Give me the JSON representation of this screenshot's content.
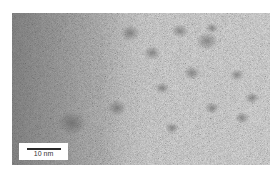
{
  "figure": {
    "type": "TEM micrograph",
    "colors": {
      "background": "#ffffff",
      "base_gray": "#a9a9a9",
      "dark_region": "#6e6e6e",
      "particle": "#707070"
    },
    "scale_bar": {
      "label": "10 nm",
      "length_px": 34
    },
    "particles": [
      {
        "cx": 118,
        "cy": 20,
        "r": 8
      },
      {
        "cx": 168,
        "cy": 18,
        "r": 7
      },
      {
        "cx": 195,
        "cy": 28,
        "r": 9
      },
      {
        "cx": 200,
        "cy": 15,
        "r": 5
      },
      {
        "cx": 180,
        "cy": 60,
        "r": 7
      },
      {
        "cx": 225,
        "cy": 62,
        "r": 6
      },
      {
        "cx": 150,
        "cy": 75,
        "r": 6
      },
      {
        "cx": 140,
        "cy": 40,
        "r": 7
      },
      {
        "cx": 240,
        "cy": 85,
        "r": 6
      },
      {
        "cx": 200,
        "cy": 95,
        "r": 6
      },
      {
        "cx": 230,
        "cy": 105,
        "r": 6
      },
      {
        "cx": 60,
        "cy": 110,
        "r": 12
      },
      {
        "cx": 105,
        "cy": 95,
        "r": 8
      },
      {
        "cx": 160,
        "cy": 115,
        "r": 6
      }
    ]
  }
}
